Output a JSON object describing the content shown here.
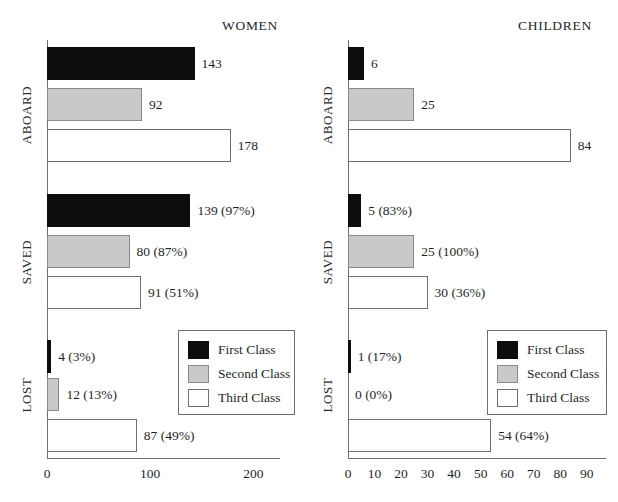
{
  "chart_data": {
    "type": "bar",
    "title": "",
    "orientation": "horizontal",
    "grid": false,
    "panels": [
      {
        "key": "women",
        "title": "WOMEN",
        "xlabel": "",
        "ylabel": "",
        "xlim": [
          0,
          220
        ],
        "xticks": [
          0,
          100,
          200
        ],
        "xticklabels": [
          "0",
          "100",
          "200"
        ],
        "groups": [
          {
            "label": "ABOARD",
            "bars": [
              {
                "series": "First Class",
                "value": 143,
                "label": "143"
              },
              {
                "series": "Second Class",
                "value": 92,
                "label": "92"
              },
              {
                "series": "Third Class",
                "value": 178,
                "label": "178"
              }
            ]
          },
          {
            "label": "SAVED",
            "bars": [
              {
                "series": "First Class",
                "value": 139,
                "percent": 97,
                "label": "139 (97%)"
              },
              {
                "series": "Second Class",
                "value": 80,
                "percent": 87,
                "label": "80 (87%)"
              },
              {
                "series": "Third Class",
                "value": 91,
                "percent": 51,
                "label": "91 (51%)"
              }
            ]
          },
          {
            "label": "LOST",
            "bars": [
              {
                "series": "First Class",
                "value": 4,
                "percent": 3,
                "label": "4 (3%)"
              },
              {
                "series": "Second Class",
                "value": 12,
                "percent": 13,
                "label": "12 (13%)"
              },
              {
                "series": "Third Class",
                "value": 87,
                "percent": 49,
                "label": "87 (49%)"
              }
            ]
          }
        ],
        "legend": {
          "position": "center-right",
          "entries": [
            {
              "label": "First Class",
              "color": "#0d0d0d"
            },
            {
              "label": "Second Class",
              "color": "#c9c9c9"
            },
            {
              "label": "Third Class",
              "color": "#ffffff"
            }
          ]
        }
      },
      {
        "key": "children",
        "title": "CHILDREN",
        "xlabel": "",
        "ylabel": "",
        "xlim": [
          0,
          95
        ],
        "xticks": [
          0,
          10,
          20,
          30,
          40,
          50,
          60,
          70,
          80,
          90
        ],
        "xticklabels": [
          "0",
          "10",
          "20",
          "30",
          "40",
          "50",
          "60",
          "70",
          "80",
          "90"
        ],
        "groups": [
          {
            "label": "ABOARD",
            "bars": [
              {
                "series": "First Class",
                "value": 6,
                "label": "6"
              },
              {
                "series": "Second Class",
                "value": 25,
                "label": "25"
              },
              {
                "series": "Third Class",
                "value": 84,
                "label": "84"
              }
            ]
          },
          {
            "label": "SAVED",
            "bars": [
              {
                "series": "First Class",
                "value": 5,
                "percent": 83,
                "label": "5 (83%)"
              },
              {
                "series": "Second Class",
                "value": 25,
                "percent": 100,
                "label": "25 (100%)"
              },
              {
                "series": "Third Class",
                "value": 30,
                "percent": 36,
                "label": "30 (36%)"
              }
            ]
          },
          {
            "label": "LOST",
            "bars": [
              {
                "series": "First Class",
                "value": 1,
                "percent": 17,
                "label": "1 (17%)"
              },
              {
                "series": "Second Class",
                "value": 0,
                "percent": 0,
                "label": "0 (0%)"
              },
              {
                "series": "Third Class",
                "value": 54,
                "percent": 64,
                "label": "54 (64%)"
              }
            ]
          }
        ],
        "legend": {
          "position": "center-right",
          "entries": [
            {
              "label": "First Class",
              "color": "#0d0d0d"
            },
            {
              "label": "Second Class",
              "color": "#c9c9c9"
            },
            {
              "label": "Third Class",
              "color": "#ffffff"
            }
          ]
        }
      }
    ],
    "series_names": [
      "First Class",
      "Second Class",
      "Third Class"
    ],
    "colors": {
      "first_class": "#0d0d0d",
      "second_class": "#c9c9c9",
      "third_class": "#ffffff",
      "axis": "#6e6e6e",
      "text": "#1f1f1f"
    }
  }
}
